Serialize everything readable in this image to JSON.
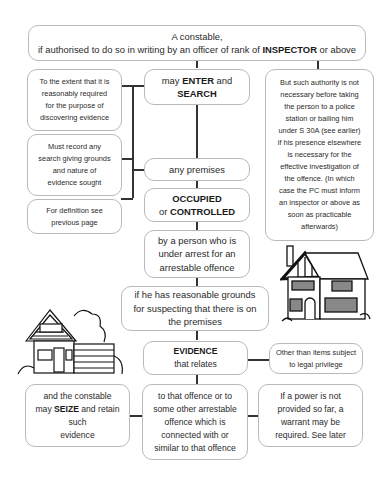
{
  "top": {
    "line1": "A constable,",
    "line2_pre": "if authorised to do so in writing by an officer of rank of ",
    "line2_bold": "INSPECTOR",
    "line2_post": " or above"
  },
  "center": {
    "enter_search": {
      "pre": "may ",
      "bold1": "ENTER",
      "mid": " and",
      "bold2": "SEARCH"
    },
    "any_premises": "any premises",
    "occupied": {
      "bold1": "OCCUPIED",
      "pre": "or ",
      "bold2": "CONTROLLED"
    },
    "person": [
      "by a person who is",
      "under arrest for an",
      "arrestable offence"
    ],
    "grounds": [
      "if he has reasonable grounds",
      "for suspecting that there is on",
      "the premises"
    ],
    "evidence": {
      "bold": "EVIDENCE",
      "text": "that relates"
    },
    "offence": [
      "to that offence or to",
      "some other arrestable",
      "offence which is",
      "connected with or",
      "similar to that offence"
    ]
  },
  "left": {
    "extent": [
      "To the extent that it is",
      "reasonably required",
      "for the purpose of",
      "discovering evidence"
    ],
    "record": [
      "Must record any",
      "search giving grounds",
      "and nature of",
      "evidence sought"
    ],
    "definition": [
      "For definition see",
      "previous page"
    ],
    "seize": {
      "line1": "and the constable",
      "pre": "may ",
      "bold": "SEIZE",
      "post": " and retain",
      "line3": "such",
      "line4": "evidence"
    }
  },
  "right": {
    "authority": [
      "But such authority is not",
      "necessary before taking",
      "the person to a police",
      "station or bailing him",
      "under S 30A (see earlier)",
      "if his presence elsewhere",
      "is necessary for the",
      "effective investigation of",
      "the offence. (In which",
      "case the PC must inform",
      "an inspector or above as",
      "soon as practicable",
      "afterwards)"
    ],
    "privilege": [
      "Other than items subject",
      "to legal privilege"
    ],
    "warrant": [
      "If a power is not",
      "provided so far, a",
      "warrant may be",
      "required. See later"
    ]
  },
  "illustrations": [
    "house-icon",
    "bungalow-icon"
  ]
}
